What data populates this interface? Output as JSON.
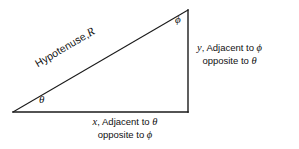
{
  "figure": {
    "type": "right-triangle-trigonometry-diagram",
    "background_color": "#ffffff",
    "stroke_color": "#1a1a1a",
    "width": 299,
    "height": 149,
    "vertices": {
      "left": [
        13,
        112
      ],
      "bottom_right": [
        188,
        112
      ],
      "top": [
        188,
        10
      ]
    },
    "angles": {
      "theta_symbol": "θ",
      "phi_symbol": "ϕ"
    },
    "hypotenuse": {
      "label_text": "Hypotenuse,",
      "label_variable": "R",
      "rotation_degrees": -30.5
    },
    "vertical_side": {
      "variable": "y",
      "line1_prefix": "y",
      "line1_text": ", Adjacent to ",
      "line1_greek": "ϕ",
      "line2_text": "opposite to ",
      "line2_greek": "θ"
    },
    "horizontal_side": {
      "variable": "x",
      "line1_prefix": "x",
      "line1_text": ", Adjacent to ",
      "line1_greek": "θ",
      "line2_text": "opposite to ",
      "line2_greek": "ϕ"
    }
  }
}
